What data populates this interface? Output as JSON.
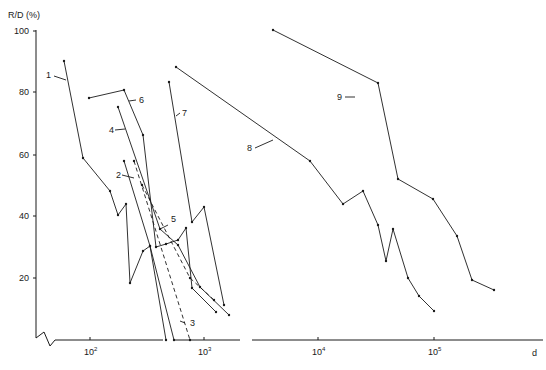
{
  "chart_data": {
    "type": "line",
    "title": "",
    "xlabel": "d",
    "ylabel": "R/D (%)",
    "x_scale": "log",
    "xlim": [
      30,
      1000000
    ],
    "ylim": [
      0,
      100
    ],
    "grid": false,
    "legend": "inline numeric labels 1-9 with arrows",
    "y_ticks": [
      "20",
      "40",
      "60",
      "80",
      "100"
    ],
    "x_ticks": [
      "10^2",
      "10^3",
      "10^4",
      "10^5"
    ],
    "series": [
      {
        "name": "1",
        "style": "solid",
        "points": [
          [
            55,
            90
          ],
          [
            85,
            59
          ],
          [
            145,
            48
          ],
          [
            170,
            40
          ],
          [
            195,
            44
          ],
          [
            215,
            18
          ],
          [
            260,
            29
          ],
          [
            290,
            30
          ],
          [
            440,
            0
          ]
        ]
      },
      {
        "name": "2",
        "style": "solid",
        "points": [
          [
            195,
            58
          ],
          [
            330,
            30
          ],
          [
            380,
            0
          ]
        ]
      },
      {
        "name": "3",
        "style": "dashed",
        "points": [
          [
            235,
            58
          ],
          [
            680,
            0
          ]
        ]
      },
      {
        "name": "4",
        "style": "solid",
        "points": [
          [
            190,
            75
          ],
          [
            400,
            37
          ],
          [
            520,
            30
          ],
          [
            800,
            16
          ],
          [
            1500,
            7
          ]
        ]
      },
      {
        "name": "5",
        "style": "dashed",
        "points": [
          [
            260,
            50
          ],
          [
            760,
            20
          ],
          [
            1100,
            14
          ]
        ]
      },
      {
        "name": "6",
        "style": "solid",
        "points": [
          [
            90,
            78
          ],
          [
            190,
            81
          ],
          [
            260,
            66
          ],
          [
            400,
            30
          ],
          [
            550,
            31
          ],
          [
            650,
            33
          ],
          [
            900,
            40
          ],
          [
            1000,
            20
          ],
          [
            1400,
            10
          ]
        ]
      },
      {
        "name": "7",
        "style": "solid",
        "points": [
          [
            570,
            83
          ],
          [
            900,
            38
          ],
          [
            1100,
            43
          ],
          [
            1600,
            11
          ]
        ]
      },
      {
        "name": "8",
        "style": "solid",
        "points": [
          [
            700,
            88
          ],
          [
            8500,
            58
          ],
          [
            17000,
            44
          ],
          [
            26000,
            48
          ],
          [
            37000,
            37
          ],
          [
            45000,
            26
          ],
          [
            50000,
            36
          ],
          [
            66000,
            20
          ],
          [
            82000,
            14
          ],
          [
            98000,
            9
          ]
        ]
      },
      {
        "name": "9",
        "style": "solid",
        "points": [
          [
            4000,
            100
          ],
          [
            19000,
            83
          ],
          [
            46000,
            52
          ],
          [
            98000,
            46
          ],
          [
            160000,
            34
          ],
          [
            220000,
            19
          ],
          [
            320000,
            16
          ]
        ]
      }
    ]
  },
  "axes": {
    "y_label": "R/D (%)",
    "x_label": "d",
    "y_ticks": [
      {
        "label": "100",
        "y": 31
      },
      {
        "label": "80",
        "y": 92
      },
      {
        "label": "60",
        "y": 155
      },
      {
        "label": "40",
        "y": 216
      },
      {
        "label": "20",
        "y": 278
      }
    ],
    "x_ticks": [
      {
        "base": "10",
        "exp": "2",
        "x": 90
      },
      {
        "base": "10",
        "exp": "3",
        "x": 204
      },
      {
        "base": "10",
        "exp": "4",
        "x": 318
      },
      {
        "base": "10",
        "exp": "5",
        "x": 434
      }
    ]
  },
  "series_labels": [
    {
      "text": "1",
      "x": 46,
      "y": 78
    },
    {
      "text": "2",
      "x": 116,
      "y": 178
    },
    {
      "text": "3",
      "x": 190,
      "y": 326
    },
    {
      "text": "4",
      "x": 109,
      "y": 133
    },
    {
      "text": "5",
      "x": 171,
      "y": 222
    },
    {
      "text": "6",
      "x": 139,
      "y": 103
    },
    {
      "text": "7",
      "x": 182,
      "y": 116
    },
    {
      "text": "8",
      "x": 247,
      "y": 151
    },
    {
      "text": "9",
      "x": 337,
      "y": 100
    }
  ],
  "colors": {
    "ink": "#1a1a1a",
    "background": "#ffffff"
  }
}
